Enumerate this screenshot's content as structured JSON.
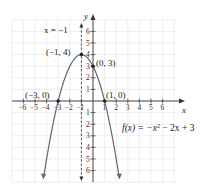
{
  "chart_data": {
    "type": "line",
    "title": "",
    "function_label": "f(x) = −x² − 2x + 3",
    "xlabel": "x",
    "ylabel": "y",
    "xlim": [
      -7,
      7
    ],
    "ylim": [
      -7,
      7
    ],
    "grid": true,
    "x_ticks": [
      -6,
      -5,
      -4,
      -3,
      -2,
      -1,
      1,
      2,
      3,
      4,
      5,
      6
    ],
    "y_ticks": [
      6,
      5,
      4,
      3,
      2,
      1,
      -1,
      -2,
      -3,
      -4,
      -5,
      -6
    ],
    "axis_of_symmetry": {
      "label": "x = −1",
      "x": -1
    },
    "points": [
      {
        "label": "(−1, 4)",
        "x": -1,
        "y": 4
      },
      {
        "label": "(0, 3)",
        "x": 0,
        "y": 3
      },
      {
        "label": "(−3, 0)",
        "x": -3,
        "y": 0
      },
      {
        "label": "(1, 0)",
        "x": 1,
        "y": 0
      }
    ],
    "series": [
      {
        "name": "f(x) = −x² − 2x + 3",
        "coefficients": {
          "a": -1,
          "b": -2,
          "c": 3
        }
      }
    ]
  },
  "labels": {
    "x_axis": "x",
    "y_axis": "y",
    "sym": "x = −1",
    "vertex": "(−1, 4)",
    "yint": "(0, 3)",
    "root_left": "(−3, 0)",
    "root_right": "(1, 0)",
    "fx": "f(x) = −x",
    "fx_exp": "2",
    "fx_rest": " − 2x + 3"
  }
}
